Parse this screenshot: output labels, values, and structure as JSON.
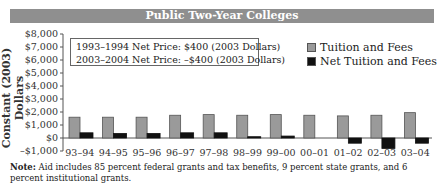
{
  "chart_data": {
    "type": "bar",
    "title": "Public Two-Year Colleges",
    "xlabel": "",
    "ylabel": "Constant (2003) Dollars",
    "ylim": [
      -1000,
      8000
    ],
    "y_ticks": [
      "$8,000",
      "$7,000",
      "$6,000",
      "$5,000",
      "$4,000",
      "$3,000",
      "$2,000",
      "$1,000",
      "$0",
      "–$1,000"
    ],
    "categories": [
      "93–94",
      "94–95",
      "95–96",
      "96–97",
      "97–98",
      "98–99",
      "99–00",
      "00–01",
      "01–02",
      "02–03",
      "03–04"
    ],
    "series": [
      {
        "name": "Tuition and Fees",
        "color": "#9a9a9a",
        "values": [
          1600,
          1600,
          1600,
          1750,
          1800,
          1750,
          1800,
          1750,
          1700,
          1750,
          1950
        ]
      },
      {
        "name": "Net Tuition and Fees",
        "color": "#111111",
        "values": [
          400,
          350,
          350,
          400,
          400,
          100,
          150,
          0,
          -400,
          -800,
          -400
        ]
      }
    ],
    "annotations": [
      "1993–1994 Net Price: $400 (2003 Dollars)",
      "2003–2004 Net Price: –$400 (2003 Dollars)"
    ],
    "legend_position": "top-right",
    "grid": false
  },
  "banner": {
    "title": "Public Two-Year Colleges"
  },
  "axis": {
    "ylabel": "Constant (2003) Dollars"
  },
  "infobox": {
    "line1": "1993–1994 Net Price: $400 (2003 Dollars)",
    "line2": "2003–2004 Net Price: –$400 (2003 Dollars)"
  },
  "legend": {
    "item1": "Tuition and Fees",
    "item2": "Net Tuition and Fees"
  },
  "note": {
    "label": "Note:",
    "text": " Aid includes 85 percent federal grants and tax benefits, 9 percent state grants, and 6 percent institutional grants."
  }
}
